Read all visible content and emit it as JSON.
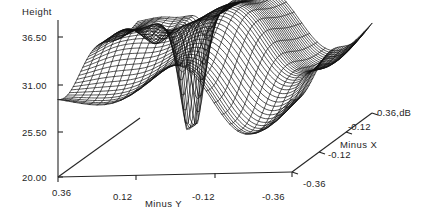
{
  "chart_data": {
    "type": "surface",
    "title": "",
    "zlabel": "Height",
    "xlabel": "Minus X",
    "ylabel": "Minus Y",
    "z_ticks": [
      "36.50",
      "31.00",
      "25.50",
      "20.00"
    ],
    "z_tick_values": [
      36.5,
      31.0,
      25.5,
      20.0
    ],
    "zlim": [
      20.0,
      39.25
    ],
    "y_ticks": [
      "0.36",
      "0.12",
      "-0.12",
      "-0.36"
    ],
    "y_tick_values": [
      0.36,
      0.12,
      -0.12,
      -0.36
    ],
    "ylim": [
      0.36,
      -0.36
    ],
    "x_ticks": [
      "-0.36",
      "-0.12",
      "-0.12",
      "0.36,dB"
    ],
    "x_tick_values": [
      -0.36,
      -0.12,
      0.12,
      0.36
    ],
    "xlim": [
      -0.36,
      0.36
    ],
    "x_corner_label": "-0.36",
    "x_top_label": "0.36,dB",
    "units": "dB",
    "grid": false,
    "legend": null,
    "projection": {
      "style": "wireframe-mesh",
      "nx": 42,
      "ny": 30,
      "line_color": "#111111"
    },
    "surface_description": "Rippled wireframe surface with a deep narrow null (well) dropping to ~20.0 near Minus Y = 0.12 on the near-left side; broad corrugated ridges crest near 39 at the far side.",
    "features": [
      {
        "name": "deep-null",
        "y": 0.14,
        "x": 0.2,
        "z": 20.3
      },
      {
        "name": "main-ridge-crest",
        "y": -0.06,
        "x": 0.3,
        "z": 39.1
      },
      {
        "name": "secondary-ridge",
        "y": 0.3,
        "x": 0.18,
        "z": 35.4
      },
      {
        "name": "far-edge-plateau",
        "y": -0.3,
        "x": -0.1,
        "z": 34.2
      }
    ],
    "z_at_left_edge": 29.4,
    "baseline": 20.0
  },
  "axes": {
    "z_axis_name": "height-axis",
    "y_axis_name": "minus-y-axis",
    "x_axis_name": "minus-x-axis"
  }
}
